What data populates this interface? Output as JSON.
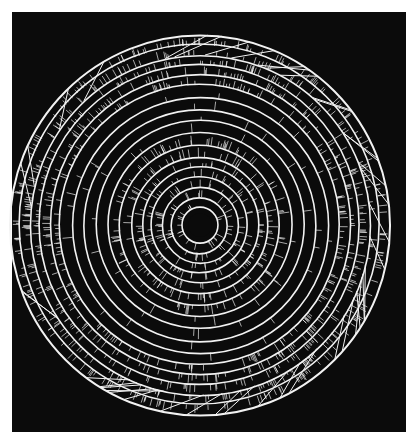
{
  "artwork": {
    "subject": "concentric rings with radial tick marks",
    "background_color": "#0b0b0b",
    "line_color": "#f2f2f2",
    "page_color": "#ffffff",
    "center": [
      200,
      225
    ],
    "core_radius": 12,
    "ring_radii": [
      18,
      28,
      38,
      48,
      58,
      68,
      80,
      92,
      104,
      116,
      128,
      140,
      150,
      160,
      170,
      180,
      190
    ],
    "dense_tick_rings": [
      0,
      1,
      2,
      3,
      4,
      5,
      6,
      11,
      12,
      13,
      14,
      15
    ]
  }
}
